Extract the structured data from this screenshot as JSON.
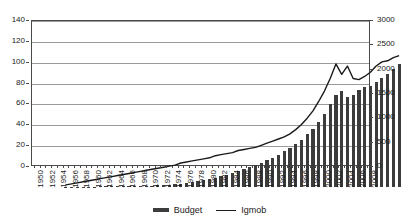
{
  "chart_data": {
    "type": "bar",
    "title": "",
    "xlabel": "",
    "ylabel": "",
    "grid": true,
    "legend_position": "bottom",
    "x": [
      1950,
      1951,
      1952,
      1953,
      1954,
      1955,
      1956,
      1957,
      1958,
      1959,
      1960,
      1961,
      1962,
      1963,
      1964,
      1965,
      1966,
      1967,
      1968,
      1969,
      1970,
      1971,
      1972,
      1973,
      1974,
      1975,
      1976,
      1977,
      1978,
      1979,
      1980,
      1981,
      1982,
      1983,
      1984,
      1985,
      1986,
      1987,
      1988,
      1989,
      1990,
      1991,
      1992,
      1993,
      1994,
      1995,
      1996,
      1997,
      1998,
      1999,
      2000,
      2001,
      2002,
      2003,
      2004,
      2005,
      2006,
      2007,
      2008
    ],
    "xtick_labels": [
      1950,
      1952,
      1954,
      1956,
      1958,
      1960,
      1962,
      1964,
      1966,
      1968,
      1970,
      1972,
      1974,
      1976,
      1978,
      1980,
      1982,
      1984,
      1986,
      1988,
      1990,
      1992,
      1994,
      1996,
      1998,
      2000,
      2002,
      2004,
      2006,
      2008
    ],
    "axes": [
      {
        "name": "left",
        "label": "",
        "lim": [
          0,
          140
        ],
        "ticks": [
          0,
          20,
          40,
          60,
          80,
          100,
          120,
          140
        ],
        "series": "Igmob"
      },
      {
        "name": "right",
        "label": "",
        "lim": [
          0,
          3000
        ],
        "ticks": [
          0,
          500,
          1000,
          1500,
          2000,
          2500,
          3000
        ],
        "series": "Budget"
      }
    ],
    "series": [
      {
        "name": "Budget",
        "type": "bar",
        "axis": "right",
        "color": "#3c3c3c",
        "values": [
          5,
          6,
          7,
          8,
          9,
          10,
          12,
          13,
          15,
          16,
          18,
          20,
          22,
          24,
          26,
          30,
          34,
          40,
          48,
          58,
          70,
          85,
          100,
          120,
          140,
          165,
          195,
          225,
          255,
          290,
          330,
          370,
          410,
          455,
          500,
          550,
          600,
          660,
          730,
          800,
          880,
          970,
          1080,
          1200,
          1340,
          1500,
          1700,
          1900,
          1980,
          1850,
          1900,
          1990,
          2050,
          2080,
          2150,
          2230,
          2320,
          2430,
          2520
        ]
      },
      {
        "name": "Igmob",
        "type": "line",
        "axis": "left",
        "color": "#1a1a1a",
        "values": [
          2,
          3,
          4,
          5,
          6,
          7,
          8,
          9,
          10,
          11,
          12,
          13,
          14,
          15,
          16,
          17,
          18,
          19,
          20,
          21,
          23,
          24,
          25,
          26,
          27,
          28,
          30,
          31,
          32,
          33,
          35,
          36,
          37,
          38,
          40,
          42,
          44,
          46,
          48,
          51,
          55,
          60,
          66,
          73,
          82,
          92,
          104,
          118,
          108,
          116,
          104,
          103,
          106,
          110,
          116,
          120,
          121,
          124,
          126
        ]
      }
    ]
  },
  "legend": {
    "items": [
      {
        "label": "Budget",
        "swatch": "bar-swatch",
        "color": "#3c3c3c"
      },
      {
        "label": "Igmob",
        "swatch": "line-swatch",
        "color": "#1a1a1a"
      }
    ]
  }
}
